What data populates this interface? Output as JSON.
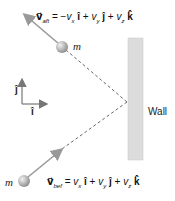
{
  "diagram": {
    "title": "",
    "wall_label": "Wall",
    "mass_label": "m",
    "unit_i": "î",
    "unit_j": "ĵ",
    "eq_after": {
      "lhs": "v⃗",
      "sub": "aft",
      "rhs": "= −v",
      "rest": " î  +  v",
      "rest2": " ĵ  +  v",
      "k": " k̂"
    },
    "eq_before": {
      "lhs": "v⃗",
      "sub": "bef",
      "rhs": "= v",
      "rest": " î  +  v",
      "rest2": " ĵ  +  v",
      "k": " k̂"
    },
    "eq_after_text": "v⃗aft = −vx î + vy ĵ + vz k̂",
    "eq_before_text": "v⃗bef = vx î + vy ĵ + vz k̂",
    "colors": {
      "arrow": "#999999",
      "dash": "#666666",
      "wall": "#d9d9d9",
      "ball": "#b0b0b0"
    }
  }
}
